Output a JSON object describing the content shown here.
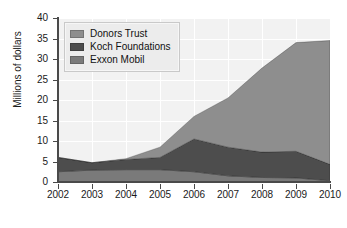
{
  "chart_data": {
    "type": "area",
    "stacked": true,
    "title": "",
    "subtitle": "",
    "xlabel": "",
    "ylabel": "Millions of dollars",
    "categories": [
      "2002",
      "2003",
      "2004",
      "2005",
      "2006",
      "2007",
      "2008",
      "2009",
      "2010"
    ],
    "x": [
      2002,
      2003,
      2004,
      2005,
      2006,
      2007,
      2008,
      2009,
      2010
    ],
    "xlim": [
      2002,
      2010
    ],
    "ylim": [
      0,
      40
    ],
    "yticks": [
      0,
      5,
      10,
      15,
      20,
      25,
      30,
      35,
      40
    ],
    "ytick_labels": [
      "0",
      "5",
      "10",
      "15",
      "20",
      "25",
      "30",
      "35",
      "40"
    ],
    "xticks": [
      2002,
      2003,
      2004,
      2005,
      2006,
      2007,
      2008,
      2009,
      2010
    ],
    "grid": true,
    "grid_color": "#ffffff",
    "plot_background": "#f2f2f2",
    "legend_position": "top-left",
    "stack_order_bottom_to_top": [
      "Exxon Mobil",
      "Koch Foundations",
      "Donors Trust"
    ],
    "series": [
      {
        "name": "Donors Trust",
        "color": "#8e8e8e",
        "values": [
          0,
          0,
          0.2,
          2.5,
          5.5,
          12.0,
          20.5,
          26.5,
          30.2
        ]
      },
      {
        "name": "Koch Foundations",
        "color": "#4d4d4d",
        "values": [
          3.5,
          1.8,
          2.5,
          3.0,
          8.0,
          7.0,
          6.2,
          6.5,
          4.0
        ]
      },
      {
        "name": "Exxon Mobil",
        "color": "#7a7a7a",
        "values": [
          2.5,
          2.9,
          3.0,
          3.0,
          2.5,
          1.5,
          1.1,
          1.0,
          0.3
        ]
      }
    ],
    "stacked_totals": [
      6.0,
      4.7,
      5.7,
      8.5,
      16.0,
      20.5,
      27.8,
      34.0,
      34.5
    ]
  },
  "legend": {
    "items": [
      {
        "label": "Donors Trust",
        "color": "#8e8e8e"
      },
      {
        "label": "Koch Foundations",
        "color": "#4d4d4d"
      },
      {
        "label": "Exxon Mobil",
        "color": "#7a7a7a"
      }
    ]
  },
  "axes": {
    "y_title": "Millions of dollars",
    "y_ticks": [
      "0",
      "5",
      "10",
      "15",
      "20",
      "25",
      "30",
      "35",
      "40"
    ],
    "x_ticks": [
      "2002",
      "2003",
      "2004",
      "2005",
      "2006",
      "2007",
      "2008",
      "2009",
      "2010"
    ]
  }
}
